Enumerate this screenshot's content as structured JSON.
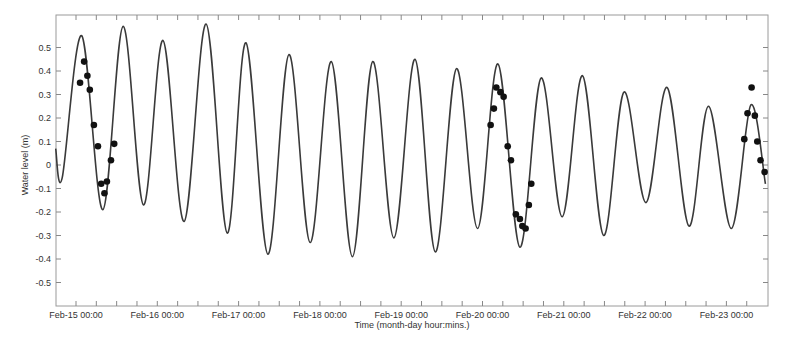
{
  "chart_data": {
    "type": "line",
    "title": "",
    "xlabel": "Time (month-day hour:mins.)",
    "ylabel": "Water level (m)",
    "ylim": [
      -0.58,
      0.6
    ],
    "yticks": [
      0.5,
      0.4,
      0.3,
      0.2,
      0.1,
      0,
      -0.1,
      -0.2,
      -0.3,
      -0.4,
      -0.5
    ],
    "ytick_labels": [
      "0.5",
      "0.4",
      "0.3",
      "0.2",
      "0.1",
      "0",
      "-0.1",
      "-0.2",
      "-0.3",
      "-0.4",
      "-0.5"
    ],
    "xtick_labels": [
      "Feb-15 00:00",
      "Feb-16 00:00",
      "Feb-17 00:00",
      "Feb-18 00:00",
      "Feb-19 00:00",
      "Feb-20 00:00",
      "Feb-21 00:00",
      "Feb-22 00:00",
      "Feb-23 00:00"
    ],
    "x_unit": "days since Feb-15 00:00",
    "xlim": [
      -0.25,
      8.48
    ],
    "grid": false,
    "legend": null,
    "series": [
      {
        "name": "Predicted water level",
        "style": "line",
        "color": "#3a3a3a",
        "points": [
          [
            -0.25,
            0.07
          ],
          [
            -0.17,
            -0.055
          ],
          [
            0.07,
            0.55
          ],
          [
            0.33,
            -0.19
          ],
          [
            0.58,
            0.59
          ],
          [
            0.83,
            -0.17
          ],
          [
            1.07,
            0.53
          ],
          [
            1.33,
            -0.24
          ],
          [
            1.6,
            0.6
          ],
          [
            1.86,
            -0.29
          ],
          [
            2.09,
            0.52
          ],
          [
            2.36,
            -0.38
          ],
          [
            2.62,
            0.47
          ],
          [
            2.88,
            -0.33
          ],
          [
            3.14,
            0.44
          ],
          [
            3.4,
            -0.39
          ],
          [
            3.65,
            0.44
          ],
          [
            3.91,
            -0.31
          ],
          [
            4.17,
            0.45
          ],
          [
            4.42,
            -0.37
          ],
          [
            4.68,
            0.41
          ],
          [
            4.94,
            -0.27
          ],
          [
            5.19,
            0.43
          ],
          [
            5.46,
            -0.35
          ],
          [
            5.72,
            0.37
          ],
          [
            5.98,
            -0.22
          ],
          [
            6.23,
            0.38
          ],
          [
            6.49,
            -0.3
          ],
          [
            6.74,
            0.31
          ],
          [
            7.01,
            -0.16
          ],
          [
            7.27,
            0.33
          ],
          [
            7.54,
            -0.26
          ],
          [
            7.78,
            0.25
          ],
          [
            8.06,
            -0.27
          ],
          [
            8.3,
            0.255
          ],
          [
            8.48,
            -0.08
          ]
        ]
      },
      {
        "name": "Observed water level",
        "style": "markers",
        "color": "#111111",
        "points": [
          [
            0.05,
            0.35
          ],
          [
            0.1,
            0.44
          ],
          [
            0.14,
            0.38
          ],
          [
            0.17,
            0.32
          ],
          [
            0.22,
            0.17
          ],
          [
            0.27,
            0.08
          ],
          [
            0.31,
            -0.08
          ],
          [
            0.35,
            -0.12
          ],
          [
            0.38,
            -0.07
          ],
          [
            0.43,
            0.02
          ],
          [
            0.47,
            0.09
          ],
          [
            5.1,
            0.17
          ],
          [
            5.14,
            0.24
          ],
          [
            5.17,
            0.33
          ],
          [
            5.22,
            0.31
          ],
          [
            5.26,
            0.29
          ],
          [
            5.31,
            0.08
          ],
          [
            5.35,
            0.02
          ],
          [
            5.41,
            -0.21
          ],
          [
            5.46,
            -0.23
          ],
          [
            5.49,
            -0.26
          ],
          [
            5.53,
            -0.27
          ],
          [
            5.57,
            -0.17
          ],
          [
            5.6,
            -0.08
          ],
          [
            8.22,
            0.11
          ],
          [
            8.26,
            0.22
          ],
          [
            8.31,
            0.33
          ],
          [
            8.35,
            0.21
          ],
          [
            8.38,
            0.1
          ],
          [
            8.42,
            0.02
          ],
          [
            8.47,
            -0.03
          ]
        ]
      }
    ]
  }
}
